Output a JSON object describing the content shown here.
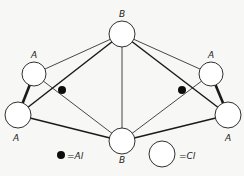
{
  "diagram": {
    "title": "",
    "nodes": [
      {
        "id": "B_top",
        "label": "B",
        "type": "Cl",
        "cx": 122,
        "cy": 34,
        "r": 13,
        "label_x": 122,
        "label_y": 17
      },
      {
        "id": "A_ul",
        "label": "A",
        "type": "Cl",
        "cx": 34,
        "cy": 74,
        "r": 12,
        "label_x": 34,
        "label_y": 58
      },
      {
        "id": "A_ll",
        "label": "A",
        "type": "Cl",
        "cx": 18,
        "cy": 115,
        "r": 13,
        "label_x": 16,
        "label_y": 141
      },
      {
        "id": "A_ur",
        "label": "A",
        "type": "Cl",
        "cx": 211,
        "cy": 74,
        "r": 12,
        "label_x": 211,
        "label_y": 58
      },
      {
        "id": "A_lr",
        "label": "A",
        "type": "Cl",
        "cx": 228,
        "cy": 115,
        "r": 13,
        "label_x": 228,
        "label_y": 141
      },
      {
        "id": "B_bot",
        "label": "B",
        "type": "Cl",
        "cx": 122,
        "cy": 141,
        "r": 13,
        "label_x": 122,
        "label_y": 163
      }
    ],
    "al_atoms": [
      {
        "id": "Al_left",
        "cx": 62,
        "cy": 90,
        "r": 4
      },
      {
        "id": "Al_right",
        "cx": 182,
        "cy": 90,
        "r": 4
      }
    ],
    "edges": [
      {
        "from": "B_top",
        "to": "A_ul",
        "weight": "thin"
      },
      {
        "from": "B_top",
        "to": "A_ll",
        "weight": "thick"
      },
      {
        "from": "B_top",
        "to": "B_bot",
        "weight": "thin"
      },
      {
        "from": "B_top",
        "to": "A_ur",
        "weight": "thin"
      },
      {
        "from": "B_top",
        "to": "A_lr",
        "weight": "thick"
      },
      {
        "from": "A_ul",
        "to": "A_ll",
        "weight": "bold"
      },
      {
        "from": "A_ur",
        "to": "A_lr",
        "weight": "bold"
      },
      {
        "from": "A_ll",
        "to": "B_bot",
        "weight": "thick"
      },
      {
        "from": "A_lr",
        "to": "B_bot",
        "weight": "thick"
      },
      {
        "from": "A_ul",
        "to": "B_bot",
        "weight": "thin"
      },
      {
        "from": "A_ur",
        "to": "B_bot",
        "weight": "thin"
      }
    ],
    "legend": [
      {
        "symbol": "filled-dot",
        "text": "=Al",
        "meaning": "Al"
      },
      {
        "symbol": "open-circle",
        "text": "=Cl",
        "meaning": "Cl"
      }
    ],
    "colors": {
      "background": "#f7f7f5",
      "stroke": "#1a1a1a",
      "fill_open": "#ffffff",
      "fill_al": "#0d0d0d"
    }
  }
}
